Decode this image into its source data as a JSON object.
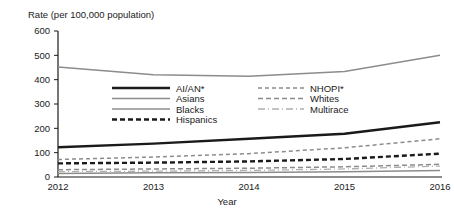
{
  "chart_data": {
    "type": "line",
    "title": "",
    "ylabel": "Rate (per 100,000 population)",
    "xlabel": "Year",
    "x": [
      2012,
      2013,
      2014,
      2015,
      2016
    ],
    "xtick_labels": [
      "2012",
      "2013",
      "2014",
      "2015",
      "2016"
    ],
    "ytick_labels": [
      "0",
      "100",
      "200",
      "300",
      "400",
      "500",
      "600"
    ],
    "yticks": [
      0,
      100,
      200,
      300,
      400,
      500,
      600
    ],
    "ylim": [
      0,
      600
    ],
    "xlim": [
      2012,
      2016
    ],
    "grid": false,
    "legend_position": "inside-upper-center",
    "series": [
      {
        "name": "AI/AN*",
        "values": [
          122,
          137,
          157,
          178,
          225
        ],
        "color": "#1a1a1a",
        "width": 2.4,
        "dash": "none"
      },
      {
        "name": "Asians",
        "values": [
          14,
          17,
          19,
          22,
          27
        ],
        "color": "#8c8c8c",
        "width": 1.5,
        "dash": "none"
      },
      {
        "name": "Blacks",
        "values": [
          452,
          420,
          414,
          434,
          500
        ],
        "color": "#8c8c8c",
        "width": 1.5,
        "dash": "none"
      },
      {
        "name": "Hispanics",
        "values": [
          56,
          59,
          64,
          74,
          96
        ],
        "color": "#1a1a1a",
        "width": 2.4,
        "dash": "5,3"
      },
      {
        "name": "NHOPI*",
        "values": [
          72,
          82,
          96,
          120,
          157
        ],
        "color": "#8c8c8c",
        "width": 1.5,
        "dash": "4,3"
      },
      {
        "name": "Whites",
        "values": [
          30,
          33,
          36,
          42,
          52
        ],
        "color": "#8c8c8c",
        "width": 1.5,
        "dash": "5,3"
      },
      {
        "name": "Multirace",
        "values": [
          22,
          24,
          27,
          33,
          45
        ],
        "color": "#b0b0b0",
        "width": 1.3,
        "dash": "7,3,1,3"
      }
    ],
    "legend": {
      "column_left": [
        "AI/AN*",
        "Asians",
        "Blacks",
        "Hispanics"
      ],
      "column_right": [
        "NHOPI*",
        "Whites",
        "Multirace"
      ]
    }
  }
}
